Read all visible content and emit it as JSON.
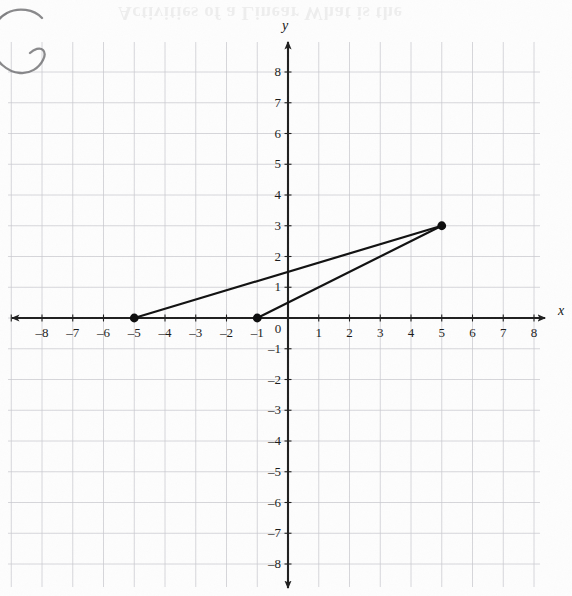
{
  "page": {
    "width": 572,
    "height": 596,
    "background": "#fdfdfd",
    "ghost_header_text": "Activities of a Linear  What is the"
  },
  "annotations": {
    "hand_drawn_circle": {
      "name": "hand-drawn-circle-mark",
      "stroke": "#6f6f72",
      "description": "pencil circle scribble in top-left margin"
    }
  },
  "chart_data": {
    "type": "scatter",
    "title": "",
    "subtitle": "",
    "xlabel": "x",
    "ylabel": "y",
    "xlim": [
      -8.5,
      8.5
    ],
    "ylim": [
      -8.5,
      8.5
    ],
    "xticks": [
      -8,
      -7,
      -6,
      -5,
      -4,
      -3,
      -2,
      -1,
      0,
      1,
      2,
      3,
      4,
      5,
      6,
      7,
      8
    ],
    "yticks": [
      8,
      7,
      6,
      5,
      4,
      3,
      2,
      1,
      -1,
      -2,
      -3,
      -4,
      -5,
      -6,
      -7,
      -8
    ],
    "xticklabels": [
      "–8",
      "–7",
      "–6",
      "–5",
      "–4",
      "–3",
      "–2",
      "–1",
      "0",
      "1",
      "2",
      "3",
      "4",
      "5",
      "6",
      "7",
      "8"
    ],
    "yticklabels": [
      "8",
      "7",
      "6",
      "5",
      "4",
      "3",
      "2",
      "1",
      "–1",
      "–2",
      "–3",
      "–4",
      "–5",
      "–6",
      "–7",
      "–8"
    ],
    "origin_label": "0",
    "grid": true,
    "grid_color": "#c9c9cf",
    "axis_color": "#1f1f1f",
    "legend": null,
    "points": [
      {
        "label": "A",
        "x": -5,
        "y": 0
      },
      {
        "label": "B",
        "x": -1,
        "y": 0
      },
      {
        "label": "C",
        "x": 5,
        "y": 3
      }
    ],
    "series": [
      {
        "name": "segment-A-C",
        "type": "line",
        "x": [
          -5,
          5
        ],
        "y": [
          0,
          3
        ],
        "color": "#111111"
      },
      {
        "name": "segment-B-C",
        "type": "line",
        "x": [
          -1,
          5
        ],
        "y": [
          0,
          3
        ],
        "color": "#111111"
      }
    ],
    "point_color": "#0d0d0d",
    "line_color": "#111111"
  },
  "geometry": {
    "origin_px": {
      "x": 288,
      "y": 318
    },
    "unit_px": 30.75,
    "grid_left_px": 8,
    "grid_right_px": 540,
    "grid_top_px": 42,
    "grid_bottom_px": 587
  }
}
